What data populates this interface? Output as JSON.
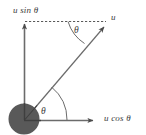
{
  "diagram": {
    "background_color": "#ffffff",
    "stroke_color": "#5a5a5a",
    "ball_color": "#595959",
    "labels": {
      "vertical_component": "u sin θ",
      "resultant_vector": "u",
      "horizontal_component": "u cos θ",
      "angle_top": "θ",
      "angle_bottom": "θ"
    },
    "elements": {
      "ball": "filled-circle-at-origin",
      "vertical_axis": "solid-arrow-up",
      "horizontal_axis": "solid-arrow-right",
      "resultant": "solid-arrow-diagonal",
      "projection_line": "dashed-horizontal"
    }
  }
}
